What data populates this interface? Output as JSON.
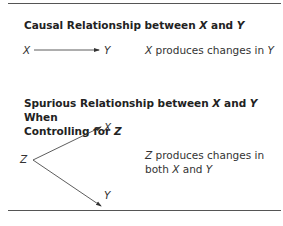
{
  "causal": {
    "heading_pre": "Causal Relationship between ",
    "heading_x": "X",
    "heading_mid": " and ",
    "heading_y": "Y",
    "node_x": "X",
    "node_y": "Y",
    "desc_x": "X",
    "desc_rest": " produces changes in ",
    "desc_y": "Y"
  },
  "spurious": {
    "heading_pre": "Spurious Relationship between ",
    "heading_x": "X",
    "heading_mid": " and ",
    "heading_y": "Y",
    "heading_post": " When",
    "heading_line2_pre": "Controlling for ",
    "heading_z": "Z",
    "node_z": "Z",
    "node_x": "X",
    "node_y": "Y",
    "desc_z": "Z",
    "desc_line1_rest": " produces changes in",
    "desc_line2_pre": "both ",
    "desc_x": "X",
    "desc_mid": " and ",
    "desc_y": "Y"
  }
}
